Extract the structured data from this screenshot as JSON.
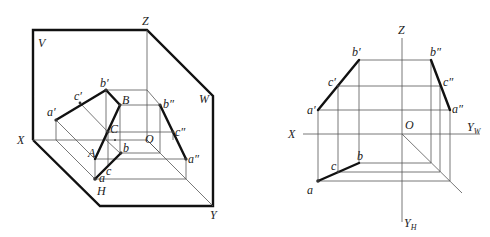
{
  "figure": {
    "left": {
      "planes": {
        "V": "V",
        "W": "W",
        "H": "H"
      },
      "axes": {
        "X": "X",
        "Y": "Y",
        "Z": "Z",
        "O": "O"
      },
      "points": {
        "a_prime": "a′",
        "b_prime": "b′",
        "c_prime": "c′",
        "a_dprime": "a″",
        "b_dprime": "b″",
        "c_dprime": "c″",
        "a": "a",
        "b": "b",
        "c": "c",
        "A": "A",
        "B": "B",
        "C": "C"
      }
    },
    "right": {
      "axes": {
        "X": "X",
        "Z": "Z",
        "O": "O",
        "Y": "Y",
        "YW_sub": "W",
        "YH_sub": "H"
      },
      "points": {
        "a_prime": "a′",
        "b_prime": "b′",
        "c_prime": "c′",
        "a_dprime": "a″",
        "b_dprime": "b″",
        "c_dprime": "c″",
        "a": "a",
        "b": "b",
        "c": "c"
      }
    }
  }
}
